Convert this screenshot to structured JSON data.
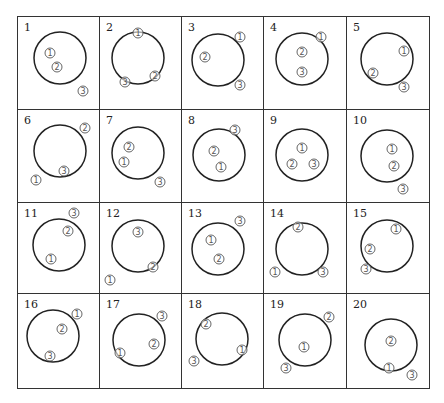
{
  "diagram": {
    "rows": 4,
    "cols": 5,
    "stroke_color": "#222222",
    "marker_color": "#555555",
    "markers_glyphs": {
      "1": "①",
      "2": "②",
      "3": "③"
    },
    "cells": [
      {
        "number": "1",
        "circle": {
          "cx": 42,
          "cy": 41,
          "r": 26
        },
        "markers": [
          {
            "label": "①",
            "x": 32,
            "y": 36
          },
          {
            "label": "②",
            "x": 39,
            "y": 50
          },
          {
            "label": "③",
            "x": 65,
            "y": 74
          }
        ]
      },
      {
        "number": "2",
        "circle": {
          "cx": 38,
          "cy": 41,
          "r": 26
        },
        "markers": [
          {
            "label": "①",
            "x": 38,
            "y": 16
          },
          {
            "label": "②",
            "x": 55,
            "y": 59
          },
          {
            "label": "③",
            "x": 25,
            "y": 65
          }
        ]
      },
      {
        "number": "3",
        "circle": {
          "cx": 36,
          "cy": 43,
          "r": 26
        },
        "markers": [
          {
            "label": "①",
            "x": 58,
            "y": 20
          },
          {
            "label": "②",
            "x": 23,
            "y": 40
          },
          {
            "label": "③",
            "x": 58,
            "y": 68
          }
        ]
      },
      {
        "number": "4",
        "circle": {
          "cx": 38,
          "cy": 42,
          "r": 26
        },
        "markers": [
          {
            "label": "①",
            "x": 57,
            "y": 20
          },
          {
            "label": "②",
            "x": 38,
            "y": 35
          },
          {
            "label": "③",
            "x": 38,
            "y": 55
          }
        ]
      },
      {
        "number": "5",
        "circle": {
          "cx": 40,
          "cy": 42,
          "r": 26
        },
        "markers": [
          {
            "label": "①",
            "x": 57,
            "y": 34
          },
          {
            "label": "②",
            "x": 26,
            "y": 56
          },
          {
            "label": "③",
            "x": 57,
            "y": 70
          }
        ]
      },
      {
        "number": "6",
        "circle": {
          "cx": 42,
          "cy": 41,
          "r": 26
        },
        "markers": [
          {
            "label": "②",
            "x": 67,
            "y": 18
          },
          {
            "label": "③",
            "x": 46,
            "y": 61
          },
          {
            "label": "①",
            "x": 18,
            "y": 70
          }
        ]
      },
      {
        "number": "7",
        "circle": {
          "cx": 38,
          "cy": 43,
          "r": 26
        },
        "markers": [
          {
            "label": "②",
            "x": 29,
            "y": 37
          },
          {
            "label": "①",
            "x": 24,
            "y": 52
          },
          {
            "label": "③",
            "x": 60,
            "y": 72
          }
        ]
      },
      {
        "number": "8",
        "circle": {
          "cx": 37,
          "cy": 45,
          "r": 26
        },
        "markers": [
          {
            "label": "③",
            "x": 53,
            "y": 20
          },
          {
            "label": "②",
            "x": 32,
            "y": 41
          },
          {
            "label": "①",
            "x": 39,
            "y": 57
          }
        ]
      },
      {
        "number": "9",
        "circle": {
          "cx": 38,
          "cy": 45,
          "r": 26
        },
        "markers": [
          {
            "label": "①",
            "x": 38,
            "y": 38
          },
          {
            "label": "②",
            "x": 28,
            "y": 54
          },
          {
            "label": "③",
            "x": 50,
            "y": 54
          }
        ]
      },
      {
        "number": "10",
        "circle": {
          "cx": 40,
          "cy": 46,
          "r": 26
        },
        "markers": [
          {
            "label": "①",
            "x": 45,
            "y": 39
          },
          {
            "label": "②",
            "x": 47,
            "y": 56
          },
          {
            "label": "③",
            "x": 56,
            "y": 79
          }
        ]
      },
      {
        "number": "11",
        "circle": {
          "cx": 41,
          "cy": 42,
          "r": 26
        },
        "markers": [
          {
            "label": "③",
            "x": 56,
            "y": 10
          },
          {
            "label": "②",
            "x": 50,
            "y": 28
          },
          {
            "label": "①",
            "x": 33,
            "y": 56
          }
        ]
      },
      {
        "number": "12",
        "circle": {
          "cx": 38,
          "cy": 43,
          "r": 26
        },
        "markers": [
          {
            "label": "③",
            "x": 38,
            "y": 29
          },
          {
            "label": "②",
            "x": 53,
            "y": 64
          },
          {
            "label": "①",
            "x": 10,
            "y": 77
          }
        ]
      },
      {
        "number": "13",
        "circle": {
          "cx": 36,
          "cy": 46,
          "r": 26
        },
        "markers": [
          {
            "label": "③",
            "x": 58,
            "y": 18
          },
          {
            "label": "①",
            "x": 29,
            "y": 37
          },
          {
            "label": "②",
            "x": 37,
            "y": 56
          }
        ]
      },
      {
        "number": "14",
        "circle": {
          "cx": 38,
          "cy": 46,
          "r": 26
        },
        "markers": [
          {
            "label": "②",
            "x": 34,
            "y": 24
          },
          {
            "label": "①",
            "x": 11,
            "y": 69
          },
          {
            "label": "③",
            "x": 59,
            "y": 69
          }
        ]
      },
      {
        "number": "15",
        "circle": {
          "cx": 40,
          "cy": 43,
          "r": 26
        },
        "markers": [
          {
            "label": "①",
            "x": 49,
            "y": 26
          },
          {
            "label": "②",
            "x": 23,
            "y": 46
          },
          {
            "label": "③",
            "x": 19,
            "y": 66
          }
        ]
      },
      {
        "number": "16",
        "circle": {
          "cx": 35,
          "cy": 42,
          "r": 26
        },
        "markers": [
          {
            "label": "①",
            "x": 59,
            "y": 20
          },
          {
            "label": "②",
            "x": 44,
            "y": 35
          },
          {
            "label": "③",
            "x": 32,
            "y": 62
          }
        ]
      },
      {
        "number": "17",
        "circle": {
          "cx": 39,
          "cy": 46,
          "r": 26
        },
        "markers": [
          {
            "label": "③",
            "x": 62,
            "y": 22
          },
          {
            "label": "②",
            "x": 54,
            "y": 50
          },
          {
            "label": "①",
            "x": 20,
            "y": 59
          }
        ]
      },
      {
        "number": "18",
        "circle": {
          "cx": 40,
          "cy": 45,
          "r": 26
        },
        "markers": [
          {
            "label": "②",
            "x": 24,
            "y": 30
          },
          {
            "label": "①",
            "x": 60,
            "y": 56
          },
          {
            "label": "③",
            "x": 12,
            "y": 67
          }
        ]
      },
      {
        "number": "19",
        "circle": {
          "cx": 41,
          "cy": 46,
          "r": 26
        },
        "markers": [
          {
            "label": "②",
            "x": 65,
            "y": 23
          },
          {
            "label": "①",
            "x": 40,
            "y": 53
          },
          {
            "label": "③",
            "x": 22,
            "y": 74
          }
        ]
      },
      {
        "number": "20",
        "circle": {
          "cx": 44,
          "cy": 51,
          "r": 26
        },
        "markers": [
          {
            "label": "②",
            "x": 44,
            "y": 47
          },
          {
            "label": "①",
            "x": 42,
            "y": 74
          },
          {
            "label": "③",
            "x": 65,
            "y": 81
          }
        ]
      }
    ]
  }
}
